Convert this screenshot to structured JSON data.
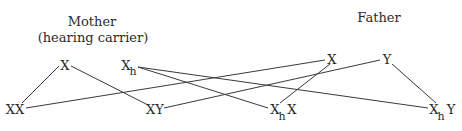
{
  "diagram": {
    "type": "punnett-cross",
    "parents": [
      {
        "id": "mother",
        "title": "Mother",
        "subtitle": "(hearing carrier)",
        "alleles": [
          {
            "id": "m_x",
            "base": "X",
            "sub": ""
          },
          {
            "id": "m_xh",
            "base": "X",
            "sub": "h"
          }
        ]
      },
      {
        "id": "father",
        "title": "Father",
        "subtitle": "",
        "alleles": [
          {
            "id": "f_x",
            "base": "X",
            "sub": ""
          },
          {
            "id": "f_y",
            "base": "Y",
            "sub": ""
          }
        ]
      }
    ],
    "offspring": [
      {
        "id": "o_xx",
        "parts": [
          {
            "base": "XX",
            "sub": ""
          }
        ]
      },
      {
        "id": "o_xy",
        "parts": [
          {
            "base": "XY",
            "sub": ""
          }
        ]
      },
      {
        "id": "o_xhx",
        "parts": [
          {
            "base": "X",
            "sub": "h"
          },
          {
            "base": "X",
            "sub": ""
          }
        ]
      },
      {
        "id": "o_xhy",
        "parts": [
          {
            "base": "X",
            "sub": "h"
          },
          {
            "base": "Y",
            "sub": ""
          }
        ]
      }
    ],
    "edges": [
      {
        "from": "m_x",
        "to": "o_xx"
      },
      {
        "from": "m_x",
        "to": "o_xy"
      },
      {
        "from": "m_xh",
        "to": "o_xhx"
      },
      {
        "from": "m_xh",
        "to": "o_xhy"
      },
      {
        "from": "f_x",
        "to": "o_xx"
      },
      {
        "from": "f_x",
        "to": "o_xhx"
      },
      {
        "from": "f_y",
        "to": "o_xy"
      },
      {
        "from": "f_y",
        "to": "o_xhy"
      }
    ]
  }
}
